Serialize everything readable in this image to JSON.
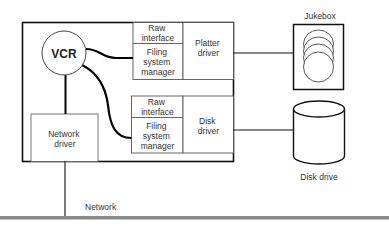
{
  "diagram": {
    "main_system": {
      "vcr": {
        "label": "VCR"
      },
      "network_driver": {
        "label_lines": [
          "Network",
          "driver"
        ]
      },
      "platter_module": {
        "raw_interface": {
          "label_lines": [
            "Raw",
            "interface"
          ]
        },
        "filing_system_manager": {
          "label_lines": [
            "Filing",
            "system",
            "manager"
          ]
        },
        "driver": {
          "label_lines": [
            "Platter",
            "driver"
          ]
        }
      },
      "disk_module": {
        "raw_interface": {
          "label_lines": [
            "Raw",
            "interface"
          ]
        },
        "filing_system_manager": {
          "label_lines": [
            "Filing",
            "system",
            "manager"
          ]
        },
        "driver": {
          "label_lines": [
            "Disk",
            "driver"
          ]
        }
      }
    },
    "jukebox": {
      "label": "Jukebox"
    },
    "disk_drive": {
      "label": "Disk drive"
    },
    "network": {
      "label": "Network"
    }
  }
}
